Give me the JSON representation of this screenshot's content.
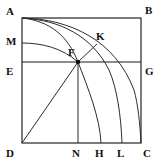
{
  "figure": {
    "background_color": "#ffffff",
    "stroke_color": "#1a1a1a",
    "width": 161,
    "height": 166,
    "labels": {
      "A": "A",
      "B": "B",
      "M": "M",
      "K": "K",
      "F": "F",
      "E": "E",
      "G": "G",
      "D": "D",
      "N": "N",
      "H": "H",
      "L": "L",
      "C": "C"
    },
    "points": [
      {
        "name": "A",
        "label": "A",
        "x": 22,
        "y": 18,
        "label_x": 6,
        "label_y": 6,
        "role": "square-corner-top-left"
      },
      {
        "name": "B",
        "label": "B",
        "x": 141,
        "y": 18,
        "label_x": 145,
        "label_y": 5,
        "role": "square-corner-top-right"
      },
      {
        "name": "M",
        "label": "M",
        "x": 22,
        "y": 43,
        "label_x": 6,
        "label_y": 36,
        "role": "left-edge-point"
      },
      {
        "name": "K",
        "label": "K",
        "x": 97,
        "y": 44,
        "label_x": 96,
        "label_y": 31,
        "role": "arc-point"
      },
      {
        "name": "F",
        "label": "F",
        "x": 78,
        "y": 62,
        "label_x": 68,
        "label_y": 47,
        "role": "convergence-point"
      },
      {
        "name": "E",
        "label": "E",
        "x": 22,
        "y": 62,
        "label_x": 6,
        "label_y": 66,
        "role": "left-edge-point"
      },
      {
        "name": "G",
        "label": "G",
        "x": 141,
        "y": 62,
        "label_x": 145,
        "label_y": 66,
        "role": "right-edge-point"
      },
      {
        "name": "D",
        "label": "D",
        "x": 22,
        "y": 143,
        "label_x": 6,
        "label_y": 148,
        "role": "square-corner-bottom-left"
      },
      {
        "name": "N",
        "label": "N",
        "x": 78,
        "y": 143,
        "label_x": 72,
        "label_y": 148,
        "role": "base-point"
      },
      {
        "name": "H",
        "label": "H",
        "x": 101,
        "y": 143,
        "label_x": 95,
        "label_y": 148,
        "role": "base-point"
      },
      {
        "name": "L",
        "label": "L",
        "x": 122,
        "y": 143,
        "label_x": 117,
        "label_y": 148,
        "role": "base-point"
      },
      {
        "name": "C",
        "label": "C",
        "x": 141,
        "y": 143,
        "label_x": 143,
        "label_y": 148,
        "role": "square-corner-bottom-right"
      }
    ],
    "segments": [
      {
        "name": "square-ABCD",
        "from": "A",
        "to": "B-C-D-A",
        "kind": "closed-rectangle"
      },
      {
        "name": "segment-EG",
        "from": "E",
        "to": "G",
        "kind": "horizontal-line"
      },
      {
        "name": "segment-FD",
        "from": "F",
        "to": "D",
        "kind": "diagonal-line"
      },
      {
        "name": "segment-FN",
        "from": "F",
        "to": "N",
        "kind": "vertical-line"
      },
      {
        "name": "segment-FK",
        "from": "F",
        "to": "K",
        "kind": "diagonal-line"
      }
    ],
    "arcs": [
      {
        "name": "arc-M-F",
        "from": "M",
        "to": "F",
        "kind": "curve"
      },
      {
        "name": "arc-A-H",
        "from": "A",
        "to": "H",
        "kind": "curve-through-F"
      },
      {
        "name": "arc-A-L",
        "from": "A",
        "to": "L",
        "kind": "curve-through-K"
      },
      {
        "name": "arc-A-C",
        "from": "A",
        "to": "C",
        "kind": "quarter-circle"
      }
    ]
  }
}
